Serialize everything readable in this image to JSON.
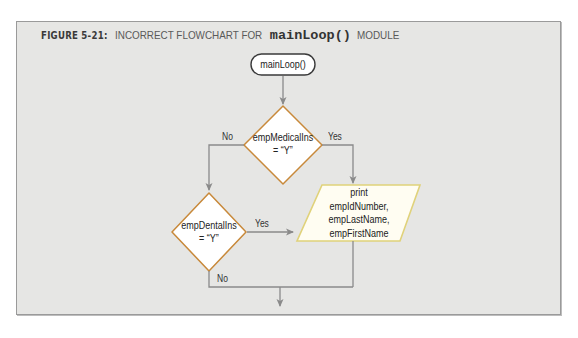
{
  "figure": {
    "label": "FIGURE 5-21:",
    "title_prefix": "INCORRECT FLOWCHART FOR",
    "title_code": "mainLoop()",
    "title_suffix": "MODULE"
  },
  "flowchart": {
    "start": {
      "type": "terminal",
      "text": "mainLoop()"
    },
    "decision1": {
      "type": "decision",
      "line1": "empMedicalIns",
      "line2": "= “Y”",
      "no_label": "No",
      "yes_label": "Yes"
    },
    "decision2": {
      "type": "decision",
      "line1": "empDentalIns",
      "line2": "= “Y”",
      "no_label": "No",
      "yes_label": "Yes"
    },
    "output": {
      "type": "io",
      "line1": "print",
      "line2": "empIdNumber,",
      "line3": "empLastName,",
      "line4": "empFirstName"
    }
  },
  "colors": {
    "panel_bg": "#e6e6e4",
    "connector": "#8a8a8a",
    "decision_stroke": "#c8893a",
    "io_stroke": "#e0d27a",
    "io_fill": "#fffdf2",
    "terminal_stroke": "#3a3a3a"
  }
}
